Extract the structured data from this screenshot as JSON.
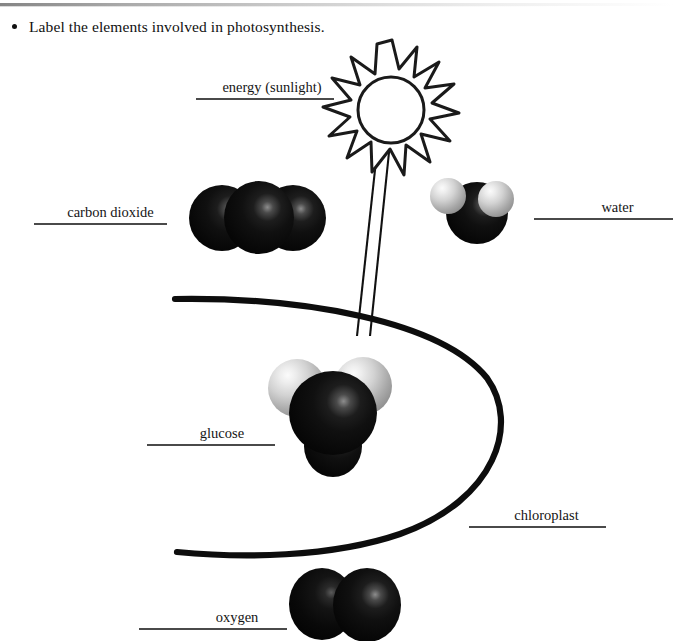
{
  "page": {
    "type": "worksheet",
    "prompt_bullet": "•",
    "prompt": "Label the elements involved in photosynthesis."
  },
  "blanks": [
    {
      "key": "energy",
      "label": "energy (sunlight)",
      "name": "blank-energy-sunlight"
    },
    {
      "key": "carbon",
      "label": "carbon dioxide",
      "name": "blank-carbon-dioxide"
    },
    {
      "key": "water",
      "label": "water",
      "name": "blank-water"
    },
    {
      "key": "glucose",
      "label": "glucose",
      "name": "blank-glucose"
    },
    {
      "key": "chloroplast",
      "label": "chloroplast",
      "name": "blank-chloroplast"
    },
    {
      "key": "oxygen",
      "label": "oxygen",
      "name": "blank-oxygen"
    }
  ],
  "diagram": {
    "sun": {
      "points": 14,
      "style": "outline",
      "inner_shape": "circle"
    },
    "light_beam": {
      "style": "two parallel thin lines",
      "direction": "from sun down-left into chloroplast"
    },
    "chloroplast": {
      "style": "thick open C curve opening left"
    },
    "molecules": [
      {
        "name": "carbon dioxide",
        "atoms": [
          "dark",
          "dark",
          "dark"
        ],
        "arrangement": "linear"
      },
      {
        "name": "water",
        "atoms": [
          "dark",
          "light",
          "light"
        ],
        "arrangement": "bent"
      },
      {
        "name": "glucose",
        "atoms": [
          "light",
          "light",
          "dark",
          "dark"
        ],
        "arrangement": "cluster"
      },
      {
        "name": "oxygen",
        "atoms": [
          "dark",
          "dark"
        ],
        "arrangement": "diatomic"
      }
    ]
  },
  "colors": {
    "ink": "#111111",
    "rule": "#4a4a4a",
    "atom_dark": "#0a0a0a",
    "atom_light": "#d2d2d2",
    "paper": "#ffffff"
  }
}
